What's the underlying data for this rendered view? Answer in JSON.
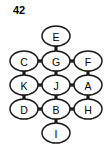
{
  "figure": {
    "label": "42",
    "background_color": "#ffffff",
    "node_fill": "#ffffff",
    "node_stroke": "#1a1a1a",
    "edge_color": "#1a1a1a"
  },
  "chart_data": {
    "type": "diagram",
    "subtype": "undirected-graph",
    "title": "42",
    "layout": "grid",
    "node_shape": "ellipse",
    "nodes": [
      {
        "id": "E",
        "label": "E",
        "cx": 56,
        "cy": 36,
        "rx": 14,
        "ry": 10
      },
      {
        "id": "C",
        "label": "C",
        "cx": 24,
        "cy": 61,
        "rx": 14,
        "ry": 10
      },
      {
        "id": "G",
        "label": "G",
        "cx": 56,
        "cy": 61,
        "rx": 14,
        "ry": 10
      },
      {
        "id": "F",
        "label": "F",
        "cx": 88,
        "cy": 61,
        "rx": 14,
        "ry": 10
      },
      {
        "id": "K",
        "label": "K",
        "cx": 24,
        "cy": 85,
        "rx": 14,
        "ry": 10
      },
      {
        "id": "J",
        "label": "J",
        "cx": 56,
        "cy": 85,
        "rx": 14,
        "ry": 10
      },
      {
        "id": "A",
        "label": "A",
        "cx": 88,
        "cy": 85,
        "rx": 14,
        "ry": 10
      },
      {
        "id": "D",
        "label": "D",
        "cx": 24,
        "cy": 109,
        "rx": 14,
        "ry": 10
      },
      {
        "id": "B",
        "label": "B",
        "cx": 56,
        "cy": 109,
        "rx": 14,
        "ry": 10
      },
      {
        "id": "H",
        "label": "H",
        "cx": 88,
        "cy": 109,
        "rx": 14,
        "ry": 10
      },
      {
        "id": "I",
        "label": "I",
        "cx": 56,
        "cy": 133,
        "rx": 14,
        "ry": 10
      }
    ],
    "edges": [
      {
        "source": "E",
        "target": "G"
      },
      {
        "source": "C",
        "target": "G"
      },
      {
        "source": "G",
        "target": "F"
      },
      {
        "source": "C",
        "target": "K"
      },
      {
        "source": "G",
        "target": "J"
      },
      {
        "source": "F",
        "target": "A"
      },
      {
        "source": "K",
        "target": "J"
      },
      {
        "source": "J",
        "target": "A"
      },
      {
        "source": "K",
        "target": "D"
      },
      {
        "source": "J",
        "target": "B"
      },
      {
        "source": "A",
        "target": "H"
      },
      {
        "source": "D",
        "target": "B"
      },
      {
        "source": "B",
        "target": "H"
      },
      {
        "source": "B",
        "target": "I"
      }
    ]
  }
}
